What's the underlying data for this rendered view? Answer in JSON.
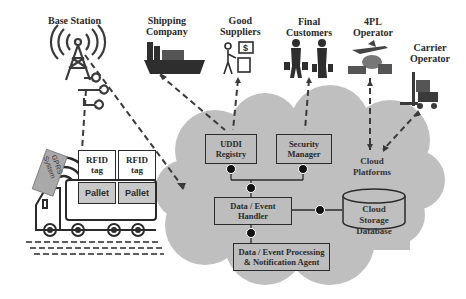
{
  "external_entities": [
    {
      "id": "base-station",
      "label": "Base Station",
      "icon": "radio-tower-icon"
    },
    {
      "id": "shipping-company",
      "label_line1": "Shipping",
      "label_line2": "Company",
      "icon": "cargo-ship-icon"
    },
    {
      "id": "good-suppliers",
      "label_line1": "Good",
      "label_line2": "Suppliers",
      "icon": "supplier-cart-icon"
    },
    {
      "id": "final-customers",
      "label_line1": "Final",
      "label_line2": "Customers",
      "icon": "travelers-icon"
    },
    {
      "id": "4pl-operator",
      "label_line1": "4PL",
      "label_line2": "Operator",
      "icon": "plane-ship-icon"
    },
    {
      "id": "carrier-operator",
      "label_line1": "Carrier",
      "label_line2": "Operator",
      "icon": "forklift-icon"
    }
  ],
  "truck": {
    "gprs_line1": "GPRS",
    "gprs_line2": "System",
    "rfid_tags": [
      {
        "line1": "RFID",
        "line2": "tag"
      },
      {
        "line1": "RFID",
        "line2": "tag"
      }
    ],
    "pallets": [
      "Pallet",
      "Pallet"
    ]
  },
  "cloud": {
    "components": {
      "uddi_line1": "UDDI",
      "uddi_line2": "Registry",
      "security_line1": "Security",
      "security_line2": "Manager",
      "handler_line1": "Data / Event",
      "handler_line2": "Handler",
      "processing_line1": "Data / Event Processing",
      "processing_line2": "& Notification Agent",
      "storage_line1": "Cloud Storage",
      "storage_line2": "Database",
      "platforms_line1": "Cloud",
      "platforms_line2": "Platforms"
    },
    "fill_color": "#bebebe"
  }
}
